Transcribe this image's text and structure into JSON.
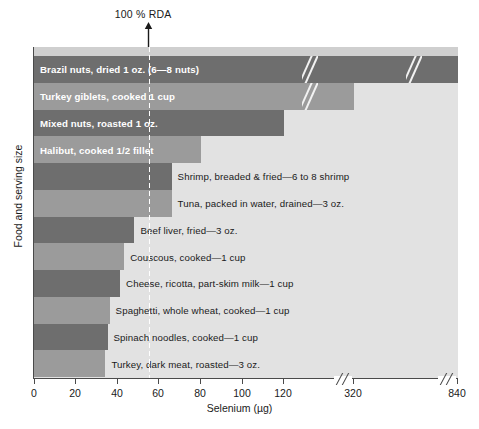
{
  "chart": {
    "type": "bar",
    "orientation": "horizontal",
    "title": "",
    "xlabel": "Selenium (µg)",
    "ylabel": "Food and serving size",
    "annotation": "100 % RDA",
    "rda_value": 55,
    "xlim": [
      0,
      840
    ],
    "xticks": [
      "0",
      "20",
      "40",
      "60",
      "80",
      "100",
      "120",
      "320",
      "840"
    ],
    "axis_breaks": 2,
    "grid": false
  },
  "chart_data": {
    "type": "bar",
    "orientation": "horizontal",
    "title": "",
    "xlabel": "Selenium (µg)",
    "ylabel": "Food and serving size",
    "xlim": [
      0,
      840
    ],
    "tick_values": [
      0,
      20,
      40,
      60,
      80,
      100,
      120,
      320,
      840
    ],
    "tick_labels": [
      "0",
      "20",
      "40",
      "60",
      "80",
      "100",
      "120",
      "320",
      "840"
    ],
    "annotations": [
      {
        "text": "100 % RDA",
        "x": 55
      }
    ],
    "categories": [
      "Brazil nuts, dried 1 oz. (6—8 nuts)",
      "Turkey giblets, cooked 1 cup",
      "Mixed nuts, roasted 1 oz.",
      "Halibut, cooked 1/2 fillet",
      "Shrimp, breaded & fried—6 to 8 shrimp",
      "Tuna, packed in water, drained—3 oz.",
      "Beef liver, fried—3 oz.",
      "Couscous, cooked—1 cup",
      "Cheese, ricotta, part-skim milk—1 cup",
      "Spaghetti, whole wheat, cooked—1 cup",
      "Turkey, dark meat, roasted—3 oz."
    ],
    "values": [
      840,
      320,
      120,
      80,
      66,
      66,
      48,
      43,
      41,
      36,
      34
    ],
    "grid": false
  },
  "bars": [
    {
      "label": "Brazil nuts, dried 1 oz. (6—8 nuts)",
      "value": 840,
      "shade": "dark",
      "label_position": "inside"
    },
    {
      "label": "Turkey giblets, cooked 1 cup",
      "value": 320,
      "shade": "light",
      "label_position": "inside"
    },
    {
      "label": "Mixed nuts, roasted 1 oz.",
      "value": 120,
      "shade": "dark",
      "label_position": "inside"
    },
    {
      "label": "Halibut, cooked 1/2 fillet",
      "value": 80,
      "shade": "light",
      "label_position": "inside"
    },
    {
      "label": "Shrimp, breaded & fried—6 to 8 shrimp",
      "value": 66,
      "shade": "dark",
      "label_position": "outside"
    },
    {
      "label": "Tuna, packed in water, drained—3 oz.",
      "value": 66,
      "shade": "light",
      "label_position": "outside"
    },
    {
      "label": "Beef liver, fried—3 oz.",
      "value": 48,
      "shade": "dark",
      "label_position": "outside"
    },
    {
      "label": "Couscous, cooked—1 cup",
      "value": 43,
      "shade": "light",
      "label_position": "outside"
    },
    {
      "label": "Cheese, ricotta, part-skim milk—1 cup",
      "value": 41,
      "shade": "dark",
      "label_position": "outside"
    },
    {
      "label": "Spaghetti, whole wheat, cooked—1 cup",
      "value": 36,
      "shade": "light",
      "label_position": "outside"
    },
    {
      "label": "Spinach noodles, cooked—1 cup",
      "value": 35,
      "shade": "dark",
      "label_position": "outside"
    },
    {
      "label": "Turkey, dark meat, roasted—3 oz.",
      "value": 34,
      "shade": "light",
      "label_position": "outside"
    }
  ],
  "colors": {
    "bar_dark": "#6e6e6e",
    "bar_light": "#9b9b9b",
    "plot_background": "#e2e2e2",
    "axis": "#4a4a4a",
    "text": "#1a1a1a",
    "inside_label": "#ffffff"
  }
}
